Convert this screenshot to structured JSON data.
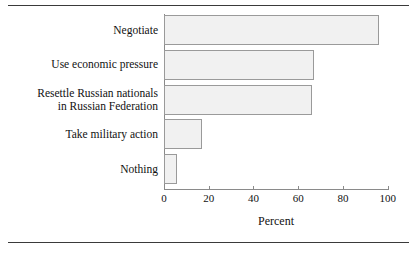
{
  "figure": {
    "has_top_rule": true,
    "has_bottom_rule": true,
    "rule_color": "#3a3a3a",
    "background": "#ffffff"
  },
  "chart_data": {
    "type": "bar",
    "orientation": "horizontal",
    "title": "",
    "xlabel": "Percent",
    "ylabel": "",
    "categories": [
      "Negotiate",
      "Use economic pressure",
      "Resettle Russian nationals\nin Russian Federation",
      "Take military action",
      "Nothing"
    ],
    "values": [
      96,
      67,
      66,
      17,
      6
    ],
    "xlim": [
      0,
      100
    ],
    "ylim": null,
    "xticks": [
      0,
      20,
      40,
      60,
      80,
      100
    ],
    "xtick_labels": [
      "0",
      "20",
      "40",
      "60",
      "80",
      "100"
    ],
    "grid": false,
    "legend": null,
    "bar_fill_color": "#f1f1f1",
    "bar_edge_color": "#9a9a9a",
    "axis_color": "#8a8a8a",
    "text_color": "#111111"
  }
}
